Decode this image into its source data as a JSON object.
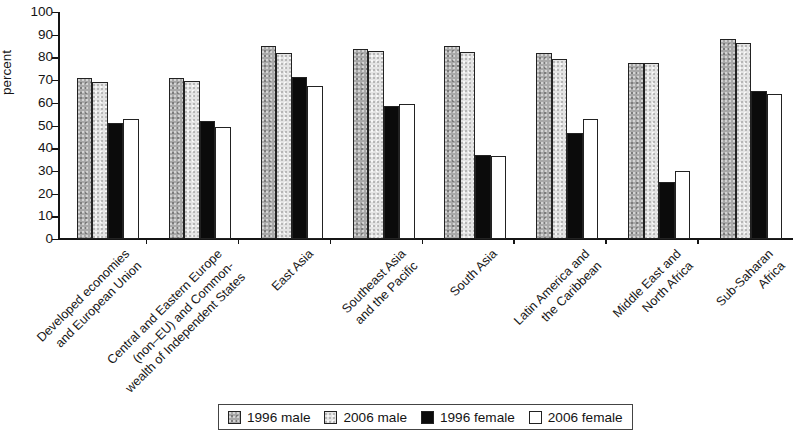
{
  "chart_data": {
    "type": "bar",
    "title": "",
    "xlabel": "",
    "ylabel": "percent",
    "ylim": [
      0,
      100
    ],
    "ytick_step": 10,
    "yticks": [
      0,
      10,
      20,
      30,
      40,
      50,
      60,
      70,
      80,
      90,
      100
    ],
    "grid": false,
    "legend_position": "bottom",
    "categories": [
      "Developed economies\nand European Union",
      "Central and Eastern Europe\n(non–EU) and Common-\nwealth of Independent States",
      "East Asia",
      "Southeast Asia\nand the Pacific",
      "South Asia",
      "Latin America and\nthe Caribbean",
      "Middle East and\nNorth Africa",
      "Sub-Saharan\nAfrica"
    ],
    "series": [
      {
        "name": "1996 male",
        "color": "#a8a8a8",
        "swatch": "sw-a",
        "values": [
          71,
          71,
          85,
          83.5,
          85,
          82,
          77.5,
          88
        ]
      },
      {
        "name": "2006 male",
        "color": "#e4e4e4",
        "swatch": "sw-b",
        "values": [
          69,
          69.5,
          82,
          83,
          82.5,
          79.5,
          77.5,
          86.5
        ]
      },
      {
        "name": "1996 female",
        "color": "#0b0b0b",
        "swatch": "sw-c",
        "values": [
          51,
          52,
          71.5,
          58.5,
          37,
          46.5,
          25,
          65
        ]
      },
      {
        "name": "2006 female",
        "color": "#ffffff",
        "swatch": "sw-d",
        "values": [
          53,
          49.5,
          67.5,
          59.5,
          36.5,
          53,
          30,
          64
        ]
      }
    ]
  }
}
